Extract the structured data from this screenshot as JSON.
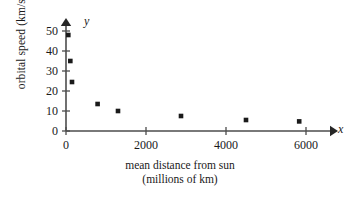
{
  "chart_data": {
    "type": "scatter",
    "title": "",
    "xlabel": "mean distance from sun (millions of km)",
    "xlabel_line1": "mean distance from sun",
    "xlabel_line2": "(millions of km)",
    "ylabel": "orbital speed (km/sec)",
    "x_axis_letter": "x",
    "y_axis_letter": "y",
    "xlim": [
      0,
      6500
    ],
    "ylim": [
      0,
      52
    ],
    "xticks": [
      0,
      2000,
      4000,
      6000
    ],
    "xtick_labels": [
      "0",
      "2000",
      "4000",
      "6000"
    ],
    "yticks": [
      0,
      10,
      20,
      30,
      40,
      50
    ],
    "ytick_labels": [
      "0",
      "10",
      "20",
      "30",
      "40",
      "50"
    ],
    "grid": false,
    "legend": null,
    "marker": "square",
    "marker_color": "#1a1a1a",
    "axis_color": "#4d4d4d",
    "points": [
      {
        "x": 58,
        "y": 48
      },
      {
        "x": 108,
        "y": 35
      },
      {
        "x": 150,
        "y": 24.5
      },
      {
        "x": 790,
        "y": 13.5
      },
      {
        "x": 1300,
        "y": 10
      },
      {
        "x": 2875,
        "y": 7.5
      },
      {
        "x": 4500,
        "y": 5.5
      },
      {
        "x": 5830,
        "y": 4.8
      }
    ]
  }
}
